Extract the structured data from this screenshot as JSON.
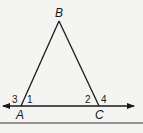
{
  "diagram": {
    "type": "geometry-triangle",
    "colors": {
      "stroke": "#1a1a1a",
      "background": "#f4f4f2"
    },
    "vertices": {
      "A": {
        "label": "A",
        "x": 21,
        "y": 106
      },
      "B": {
        "label": "B",
        "x": 59,
        "y": 21
      },
      "C": {
        "label": "C",
        "x": 99,
        "y": 106
      }
    },
    "line": {
      "description": "line through A and C with arrows at both ends",
      "x1": 3,
      "x2": 134,
      "y": 106
    },
    "angle_labels": [
      {
        "label": "3",
        "near": "A",
        "position": "exterior left"
      },
      {
        "label": "1",
        "near": "A",
        "position": "interior"
      },
      {
        "label": "2",
        "near": "C",
        "position": "interior"
      },
      {
        "label": "4",
        "near": "C",
        "position": "exterior right"
      }
    ],
    "bottom_rule": {
      "y": 123
    }
  }
}
